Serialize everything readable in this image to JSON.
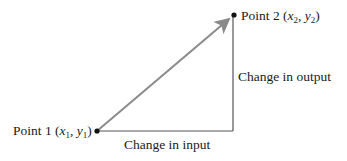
{
  "diagram": {
    "point1": {
      "name": "Point 1",
      "x_sym": "x",
      "x_sub": "1",
      "y_sym": "y",
      "y_sub": "1",
      "pos": [
        97,
        131
      ]
    },
    "point2": {
      "name": "Point 2",
      "x_sym": "x",
      "x_sub": "2",
      "y_sym": "y",
      "y_sub": "2",
      "pos": [
        233,
        15
      ]
    },
    "horizontal_label": "Change in input",
    "vertical_label": "Change in output",
    "colors": {
      "arrow": "#8a8a8a",
      "legs": "#555555",
      "points": "#111111"
    }
  }
}
